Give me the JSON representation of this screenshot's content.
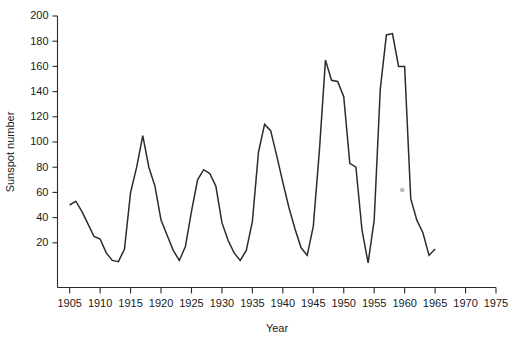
{
  "chart_data": {
    "type": "line",
    "title": "",
    "xlabel": "Year",
    "ylabel": "Sunspot number",
    "xlim": [
      1903,
      1975
    ],
    "ylim": [
      0,
      200
    ],
    "grid": false,
    "legend": null,
    "xticks": [
      1905,
      1910,
      1915,
      1920,
      1925,
      1930,
      1935,
      1940,
      1945,
      1950,
      1955,
      1960,
      1965,
      1970,
      1975
    ],
    "yticks": [
      20,
      40,
      60,
      80,
      100,
      120,
      140,
      160,
      180,
      200
    ],
    "series": [
      {
        "name": "Sunspot number",
        "color": "#2b2b2b",
        "x": [
          1905,
          1906,
          1907,
          1908,
          1909,
          1910,
          1911,
          1912,
          1913,
          1914,
          1915,
          1916,
          1917,
          1918,
          1919,
          1920,
          1921,
          1922,
          1923,
          1924,
          1925,
          1926,
          1927,
          1928,
          1929,
          1930,
          1931,
          1932,
          1933,
          1934,
          1935,
          1936,
          1937,
          1938,
          1939,
          1940,
          1941,
          1942,
          1943,
          1944,
          1945,
          1946,
          1947,
          1948,
          1949,
          1950,
          1951,
          1952,
          1953,
          1954,
          1955,
          1956,
          1957,
          1958,
          1959,
          1960,
          1961,
          1962,
          1963,
          1964,
          1965
        ],
        "y": [
          50,
          53,
          45,
          35,
          25,
          23,
          12,
          6,
          5,
          15,
          60,
          80,
          105,
          80,
          65,
          38,
          26,
          14,
          6,
          17,
          45,
          70,
          78,
          75,
          65,
          36,
          22,
          12,
          6,
          14,
          37,
          92,
          114,
          109,
          89,
          68,
          48,
          31,
          16,
          10,
          33,
          93,
          165,
          149,
          148,
          136,
          83,
          80,
          30,
          4,
          38,
          142,
          185,
          186,
          160,
          160,
          55,
          38,
          28,
          10,
          15
        ]
      }
    ],
    "annotations": [
      {
        "type": "speck",
        "note": "faint gray mark",
        "x": 1959.6,
        "y": 62
      }
    ]
  },
  "axes": {
    "y_axis_title": "Sunspot number",
    "x_axis_title": "Year"
  }
}
